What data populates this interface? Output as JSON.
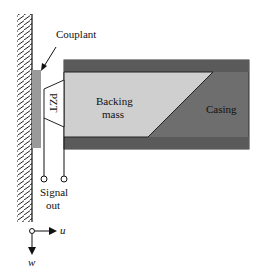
{
  "diagram": {
    "labels": {
      "couplant": "Couplant",
      "pzt": "PZT",
      "backing_line1": "Backing",
      "backing_line2": "mass",
      "casing": "Casing",
      "signal_line1": "Signal",
      "signal_line2": "out",
      "axis_u": "u",
      "axis_w": "w"
    },
    "colors": {
      "casing": "#6e6e6e",
      "casing_band": "#5a5a5a",
      "backing_mass": "#cfcfcf",
      "couplant": "#9a9a9a",
      "pzt": "#ffffff",
      "line": "#111111"
    }
  }
}
